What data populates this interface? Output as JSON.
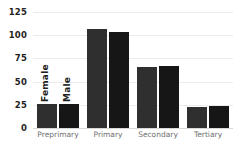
{
  "chart_data": {
    "type": "bar",
    "title": "",
    "xlabel": "",
    "ylabel": "",
    "categories": [
      "Preprimary",
      "Primary",
      "Secondary",
      "Tertiary"
    ],
    "series": [
      {
        "name": "Female",
        "values": [
          26,
          107,
          66,
          23
        ],
        "color": "#2f2f2f"
      },
      {
        "name": "Male",
        "values": [
          26,
          104,
          67,
          24
        ],
        "color": "#161616"
      }
    ],
    "ylim": [
      0,
      125
    ],
    "yticks": [
      0,
      25,
      50,
      75,
      100,
      125
    ],
    "ytick_labels": [
      "0",
      "25",
      "50",
      "75",
      "100",
      "125"
    ],
    "grid": true,
    "grid_color": "#ececec",
    "legend": "in-plot-rotated-labels",
    "legend_position": "inside first group",
    "background": "#ffffff",
    "axis_label_color": "#6f6f6f",
    "tick_label_color": "#1f1f1f"
  }
}
